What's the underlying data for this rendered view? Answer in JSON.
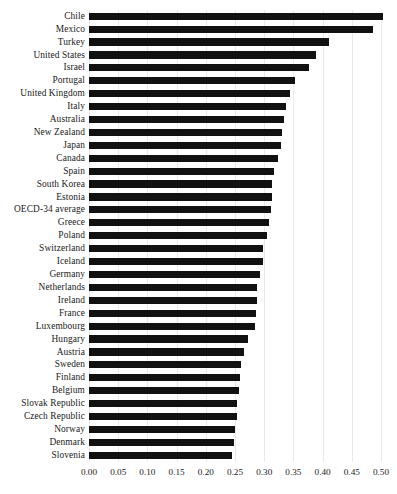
{
  "chart_data": {
    "type": "bar",
    "orientation": "horizontal",
    "title": "",
    "subtitle": "",
    "xlabel": "",
    "ylabel": "",
    "xlim": [
      0.0,
      0.5
    ],
    "ylim": null,
    "grid": true,
    "legend": null,
    "bar_color": "#111111",
    "background_color": "#ffffff",
    "gridline_color": "#e9e9e9",
    "xticks": [
      "0.00",
      "0.05",
      "0.10",
      "0.15",
      "0.20",
      "0.25",
      "0.30",
      "0.35",
      "0.40",
      "0.45",
      "0.50"
    ],
    "xtick_values": [
      0.0,
      0.05,
      0.1,
      0.15,
      0.2,
      0.25,
      0.3,
      0.35,
      0.4,
      0.45,
      0.5
    ],
    "categories": [
      "Chile",
      "Mexico",
      "Turkey",
      "United States",
      "Israel",
      "Portugal",
      "United Kingdom",
      "Italy",
      "Australia",
      "New Zealand",
      "Japan",
      "Canada",
      "Spain",
      "South Korea",
      "Estonia",
      "OECD-34 average",
      "Greece",
      "Poland",
      "Switzerland",
      "Iceland",
      "Germany",
      "Netherlands",
      "Ireland",
      "France",
      "Luxembourg",
      "Hungary",
      "Austria",
      "Sweden",
      "Finland",
      "Belgium",
      "Slovak Republic",
      "Czech Republic",
      "Norway",
      "Denmark",
      "Slovenia"
    ],
    "values": [
      0.503,
      0.486,
      0.411,
      0.389,
      0.376,
      0.353,
      0.344,
      0.337,
      0.334,
      0.33,
      0.329,
      0.324,
      0.317,
      0.314,
      0.313,
      0.312,
      0.308,
      0.305,
      0.298,
      0.298,
      0.293,
      0.288,
      0.288,
      0.286,
      0.285,
      0.272,
      0.265,
      0.26,
      0.258,
      0.257,
      0.254,
      0.253,
      0.25,
      0.249,
      0.245
    ]
  }
}
